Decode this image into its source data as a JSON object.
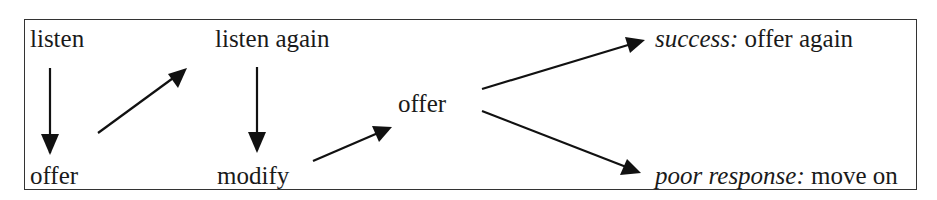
{
  "diagram": {
    "nodes": {
      "listen": {
        "label": "listen"
      },
      "offer_first": {
        "label": "offer"
      },
      "listen_again": {
        "label": "listen again"
      },
      "modify": {
        "label": "modify"
      },
      "offer_middle": {
        "label": "offer"
      },
      "success": {
        "prefix": "success:",
        "label": " offer again"
      },
      "poor_response": {
        "prefix": "poor response:",
        "label": " move on"
      }
    },
    "edges": [
      {
        "from": "listen",
        "to": "offer_first"
      },
      {
        "from": "offer_first",
        "to": "listen_again"
      },
      {
        "from": "listen_again",
        "to": "modify"
      },
      {
        "from": "modify",
        "to": "offer_middle"
      },
      {
        "from": "offer_middle",
        "to": "success"
      },
      {
        "from": "offer_middle",
        "to": "poor_response"
      }
    ],
    "colors": {
      "text": "#1a1a1a",
      "arrow": "#111111",
      "border": "#333333",
      "background": "#ffffff"
    }
  }
}
